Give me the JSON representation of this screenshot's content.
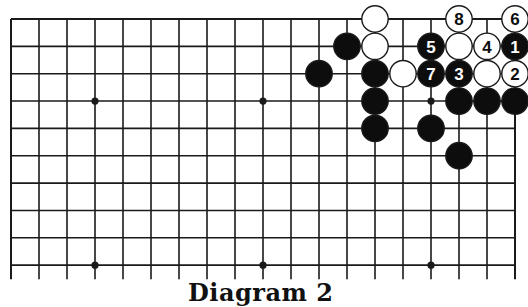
{
  "diagram": {
    "caption": "Diagram 2",
    "board": {
      "columns": 19,
      "rows_visible": 10,
      "edges": [
        "top",
        "left",
        "right"
      ],
      "origin_x": 11,
      "origin_y": 19,
      "spacing_x": 28,
      "spacing_y": 27.35,
      "line_extension_bottom": 14,
      "star_points": [
        [
          3,
          3
        ],
        [
          9,
          3
        ],
        [
          15,
          3
        ],
        [
          3,
          9
        ],
        [
          9,
          9
        ],
        [
          15,
          9
        ]
      ]
    },
    "stones": [
      {
        "col": 13,
        "row": 0,
        "color": "white",
        "label": ""
      },
      {
        "col": 16,
        "row": 0,
        "color": "white",
        "label": "8"
      },
      {
        "col": 18,
        "row": 0,
        "color": "white",
        "label": "6"
      },
      {
        "col": 12,
        "row": 1,
        "color": "black",
        "label": ""
      },
      {
        "col": 13,
        "row": 1,
        "color": "white",
        "label": ""
      },
      {
        "col": 15,
        "row": 1,
        "color": "black",
        "label": "5"
      },
      {
        "col": 16,
        "row": 1,
        "color": "white",
        "label": ""
      },
      {
        "col": 17,
        "row": 1,
        "color": "white",
        "label": "4"
      },
      {
        "col": 18,
        "row": 1,
        "color": "black",
        "label": "1"
      },
      {
        "col": 11,
        "row": 2,
        "color": "black",
        "label": ""
      },
      {
        "col": 13,
        "row": 2,
        "color": "black",
        "label": ""
      },
      {
        "col": 14,
        "row": 2,
        "color": "white",
        "label": ""
      },
      {
        "col": 15,
        "row": 2,
        "color": "black",
        "label": "7"
      },
      {
        "col": 16,
        "row": 2,
        "color": "black",
        "label": "3"
      },
      {
        "col": 17,
        "row": 2,
        "color": "white",
        "label": ""
      },
      {
        "col": 18,
        "row": 2,
        "color": "white",
        "label": "2"
      },
      {
        "col": 13,
        "row": 3,
        "color": "black",
        "label": ""
      },
      {
        "col": 16,
        "row": 3,
        "color": "black",
        "label": ""
      },
      {
        "col": 17,
        "row": 3,
        "color": "black",
        "label": ""
      },
      {
        "col": 18,
        "row": 3,
        "color": "black",
        "label": ""
      },
      {
        "col": 13,
        "row": 4,
        "color": "black",
        "label": ""
      },
      {
        "col": 15,
        "row": 4,
        "color": "black",
        "label": ""
      },
      {
        "col": 16,
        "row": 5,
        "color": "black",
        "label": ""
      }
    ],
    "colors": {
      "line": "#1a1a1a",
      "black_stone": "#0d0d0d",
      "white_stone": "#ffffff",
      "background": "#ffffff"
    }
  }
}
